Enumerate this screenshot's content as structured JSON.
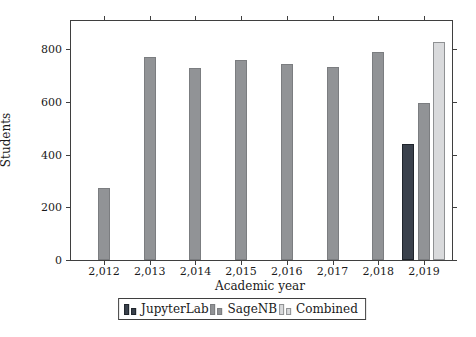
{
  "chart_data": {
    "type": "bar",
    "title": "",
    "xlabel": "Academic year",
    "ylabel": "Students",
    "categories": [
      "2,012",
      "2,013",
      "2,014",
      "2,015",
      "2,016",
      "2,017",
      "2,018",
      "2,019"
    ],
    "series": [
      {
        "name": "JupyterLab",
        "color": "#3a414c",
        "border_color": "#1f242b",
        "values": [
          null,
          null,
          null,
          null,
          null,
          null,
          null,
          440
        ]
      },
      {
        "name": "SageNB",
        "color": "#919396",
        "border_color": "#7b7d80",
        "values": [
          275,
          770,
          730,
          760,
          745,
          735,
          790,
          595
        ]
      },
      {
        "name": "Combined",
        "color": "#d9dadc",
        "border_color": "#8f9193",
        "values": [
          null,
          null,
          null,
          null,
          null,
          null,
          null,
          830
        ]
      }
    ],
    "y_ticks": [
      0,
      200,
      400,
      600,
      800
    ],
    "ylim": [
      0,
      908
    ],
    "grid": false,
    "legend_position": "bottom",
    "axis_color": "#3f3f3f"
  }
}
